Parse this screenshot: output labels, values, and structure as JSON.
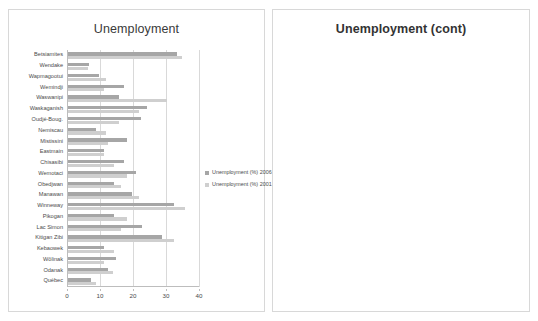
{
  "page": {
    "background": "#ffffff"
  },
  "colors": {
    "series_2006": "#a6a6a6",
    "series_2001": "#cfcfcf",
    "gridline": "#d9d9d9",
    "axis": "#bdbdbd",
    "panel_border": "#d8d8d8",
    "text": "#4a4a4a"
  },
  "charts": [
    {
      "id": "unemployment-main",
      "title": "Unemployment",
      "legend": [
        {
          "label": "Unemployment (%) 2006",
          "color": "#a6a6a6"
        },
        {
          "label": "Unemployment (%) 2001",
          "color": "#cfcfcf"
        }
      ],
      "chart_data": {
        "type": "bar",
        "orientation": "horizontal",
        "title": "Unemployment",
        "xlabel": "",
        "ylabel": "",
        "xlim": [
          0,
          40
        ],
        "xticks": [
          0,
          10,
          20,
          30,
          40
        ],
        "grid": true,
        "legend_position": "right",
        "categories": [
          "Betsiamites",
          "Wendake",
          "Wapmagootui",
          "Wemindji",
          "Waswanipi",
          "Waskaganish",
          "Oudjé-Boug.",
          "Nemiscau",
          "Mistissini",
          "Eastmain",
          "Chisasibi",
          "Wemotaci",
          "Obedjwan",
          "Manawan",
          "Winneway",
          "Pikogan",
          "Lac Simon",
          "Kitigan Zibi",
          "Kebaowek",
          "Wôlinak",
          "Odanak",
          "Québec"
        ],
        "series": [
          {
            "name": "Unemployment (%) 2006",
            "color": "#a6a6a6",
            "values": [
              33.0,
              6.5,
              9.5,
              17.0,
              15.5,
              24.0,
              22.0,
              8.5,
              18.0,
              11.0,
              17.0,
              20.5,
              14.0,
              19.5,
              32.0,
              14.0,
              22.5,
              28.5,
              11.0,
              14.5,
              12.0,
              7.0
            ]
          },
          {
            "name": "Unemployment (%) 2001",
            "color": "#cfcfcf",
            "values": [
              34.5,
              6.0,
              11.5,
              11.0,
              30.0,
              21.5,
              15.5,
              11.5,
              12.0,
              11.0,
              14.0,
              18.0,
              16.0,
              21.5,
              35.5,
              18.0,
              16.0,
              32.0,
              14.0,
              11.0,
              13.5,
              8.5
            ]
          }
        ]
      }
    },
    {
      "id": "unemployment-cont",
      "title": "Unemployment (cont)",
      "legend": [
        {
          "label": "Unemployment (%) 2006",
          "color": "#a6a6a6"
        },
        {
          "label": "Unemployment (%) 2001",
          "color": "#cfcfcf"
        }
      ],
      "chart_data": {
        "type": "bar",
        "orientation": "horizontal",
        "title": "Unemployment (cont)",
        "xlabel": "",
        "ylabel": "",
        "xlim": [
          0,
          50
        ],
        "xticks": [
          0,
          10,
          20,
          30,
          40,
          50
        ],
        "grid": true,
        "legend_position": "right",
        "categories": [
          "Umiujaq",
          "Tasiujaq",
          "Salluit",
          "Quaqtaq",
          "Puvirnituq",
          "Kujjuarapik",
          "Kuuhuaq",
          "Kangirsuk",
          "Kangiqsuq",
          "Kangiqsuq",
          "Ivujivik",
          "Inukjuak",
          "Aupaluk",
          "Kawawashi.",
          "Listuguj",
          "Cacouna",
          "Uashat",
          "Pakuashipi",
          "Natashquan",
          "Mingan",
          "Matimekosh",
          "Mashteuiatsh"
        ],
        "series": [
          {
            "name": "Unemployment (%) 2006",
            "color": "#a6a6a6",
            "values": [
              8.5,
              8.5,
              23.0,
              10.0,
              15.5,
              19.5,
              9.0,
              21.5,
              20.5,
              11.5,
              22.5,
              23.5,
              11.0,
              12.0,
              15.0,
              12.0,
              17.5,
              5.5,
              30.5,
              24.0,
              27.5,
              38.0
            ]
          },
          {
            "name": "Unemployment (%) 2001",
            "color": "#cfcfcf",
            "values": [
              12.0,
              11.5,
              27.5,
              13.0,
              19.5,
              14.0,
              12.0,
              15.5,
              12.5,
              17.0,
              27.0,
              28.5,
              14.5,
              17.5,
              26.0,
              21.0,
              9.0,
              20.0,
              23.5,
              27.0,
              35.0,
              30.5
            ]
          }
        ]
      }
    }
  ]
}
